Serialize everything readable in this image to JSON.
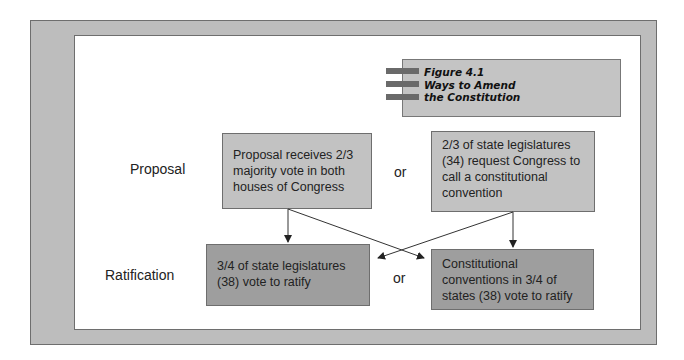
{
  "figure": {
    "number_label": "Figure 4.1",
    "title_line1": "Ways to Amend",
    "title_line2": "the Constitution"
  },
  "rows": {
    "proposal_label": "Proposal",
    "ratification_label": "Ratification"
  },
  "proposal": {
    "left_box": [
      "Proposal receives 2/3",
      "majority vote in both",
      "houses of Congress"
    ],
    "connector": "or",
    "right_box": [
      "2/3 of state legislatures",
      "(34) request Congress to",
      "call a constitutional",
      "convention"
    ]
  },
  "ratification": {
    "left_box": [
      "3/4 of state legislatures",
      "(38) vote to ratify"
    ],
    "connector": "or",
    "right_box": [
      "Constitutional",
      "conventions in 3/4 of",
      "states (38) vote to ratify"
    ]
  },
  "colors": {
    "frame": "#bdbdbd",
    "proposal_box": "#c2c2c2",
    "ratification_box": "#9e9e9e",
    "title_bars": "#6a6a6a"
  }
}
